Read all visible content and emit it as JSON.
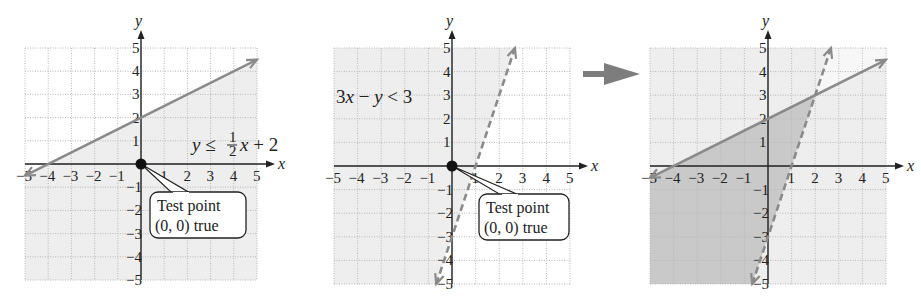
{
  "chart_data": [
    {
      "type": "line",
      "title": "",
      "xlabel": "x",
      "ylabel": "y",
      "xlim": [
        -5,
        5
      ],
      "ylim": [
        -5,
        5
      ],
      "grid": true,
      "xticks": [
        "-5",
        "-4",
        "-3",
        "-2",
        "-1",
        "1",
        "2",
        "3",
        "4",
        "5"
      ],
      "yticks": [
        "5",
        "4",
        "3",
        "2",
        "1",
        "-1",
        "-2",
        "-3",
        "-4",
        "-5"
      ],
      "series": [
        {
          "name": "y = 1/2 x + 2",
          "style": "solid",
          "x": [
            -5,
            5
          ],
          "y": [
            -0.5,
            4.5
          ]
        }
      ],
      "shaded_region": "below solid line y ≤ 1/2 x + 2",
      "annotations": [
        {
          "text": "y ≤ ½x + 2",
          "x": 1,
          "y": 1
        },
        {
          "text": "Test point (0, 0) true",
          "point": [
            0,
            0
          ]
        }
      ]
    },
    {
      "type": "line",
      "title": "",
      "xlabel": "x",
      "ylabel": "y",
      "xlim": [
        -5,
        5
      ],
      "ylim": [
        -5,
        5
      ],
      "grid": true,
      "xticks": [
        "-5",
        "-4",
        "-3",
        "-2",
        "-1",
        "1",
        "2",
        "3",
        "4",
        "5"
      ],
      "yticks": [
        "5",
        "4",
        "3",
        "2",
        "1",
        "-1",
        "-2",
        "-3",
        "-4",
        "-5"
      ],
      "series": [
        {
          "name": "3x - y = 3",
          "style": "dashed",
          "x": [
            -0.667,
            2.667
          ],
          "y": [
            -5,
            5
          ]
        }
      ],
      "shaded_region": "left of dashed line 3x - y < 3",
      "annotations": [
        {
          "text": "3x − y < 3",
          "x": -4,
          "y": 3
        },
        {
          "text": "Test point (0, 0) true",
          "point": [
            0,
            0
          ]
        }
      ]
    },
    {
      "type": "line",
      "title": "",
      "xlabel": "x",
      "ylabel": "y",
      "xlim": [
        -5,
        5
      ],
      "ylim": [
        -5,
        5
      ],
      "grid": true,
      "xticks": [
        "-5",
        "-4",
        "-3",
        "-2",
        "-1",
        "1",
        "2",
        "3",
        "4",
        "5"
      ],
      "yticks": [
        "5",
        "4",
        "3",
        "2",
        "1",
        "-1",
        "-2",
        "-3",
        "-4",
        "-5"
      ],
      "series": [
        {
          "name": "y = 1/2 x + 2",
          "style": "solid",
          "x": [
            -5,
            5
          ],
          "y": [
            -0.5,
            4.5
          ]
        },
        {
          "name": "3x - y = 3",
          "style": "dashed",
          "x": [
            -0.667,
            2.667
          ],
          "y": [
            -5,
            5
          ]
        }
      ],
      "intersection": [
        2,
        3
      ],
      "shaded_region": "overlap: y ≤ 1/2 x + 2 and 3x - y < 3"
    }
  ],
  "labels": {
    "x_axis": "x",
    "y_axis": "y",
    "panel1_equation_prefix": "y ≤ ",
    "panel1_frac_num": "1",
    "panel1_frac_den": "2",
    "panel1_equation_suffix": "x + 2",
    "panel2_equation": "3x − y < 3",
    "callout_line1": "Test point",
    "callout_line2": "(0, 0) true"
  },
  "colors": {
    "shade_light": "#eeeeee",
    "shade_dark": "#c9c9c9",
    "line": "#8a8a8a",
    "axis": "#222222",
    "grid": "#b8b8b8",
    "arrow": "#7d7d7d"
  }
}
